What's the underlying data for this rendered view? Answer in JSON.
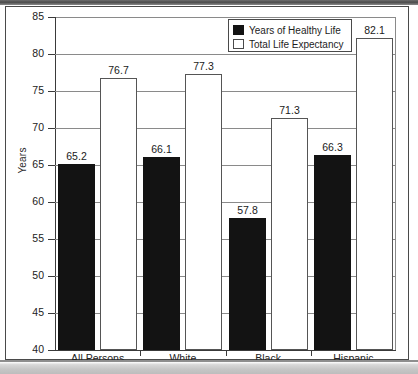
{
  "chart_data": {
    "type": "bar",
    "title": "",
    "xlabel": "",
    "ylabel": "Years",
    "ylim": [
      40,
      85
    ],
    "yticks": [
      40,
      45,
      50,
      55,
      60,
      65,
      70,
      75,
      80,
      85
    ],
    "ytick_labels": [
      "40",
      "45",
      "50",
      "55",
      "60",
      "65",
      "70",
      "75",
      "80",
      "85"
    ],
    "grid": true,
    "legend_position": "top-right",
    "categories": [
      "All Persons",
      "White",
      "Black",
      "Hispanic"
    ],
    "series": [
      {
        "name": "Years of Healthy Life",
        "color": "#131313",
        "values": [
          65.2,
          66.1,
          57.8,
          66.3
        ],
        "value_labels": [
          "65.2",
          "66.1",
          "57.8",
          "66.3"
        ]
      },
      {
        "name": "Total Life Expectancy",
        "color": "#ffffff",
        "values": [
          76.7,
          77.3,
          71.3,
          82.1
        ],
        "value_labels": [
          "76.7",
          "77.3",
          "71.3",
          "82.1"
        ]
      }
    ]
  },
  "legend": {
    "items": [
      {
        "label": "Years of Healthy Life",
        "swatch": "black-filled-square"
      },
      {
        "label": "Total Life Expectancy",
        "swatch": "white-outlined-square"
      }
    ]
  },
  "axes": {
    "y_title": "Years"
  },
  "colors": {
    "bar_healthy": "#131313",
    "bar_total": "#ffffff",
    "axis": "#3a3a3a",
    "grid": "#8a8a8a",
    "frame": "#4a4a4a",
    "text": "#1d1d1d"
  }
}
